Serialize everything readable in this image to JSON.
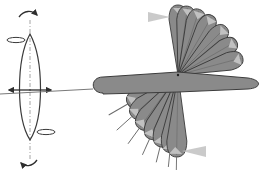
{
  "diagram": {
    "title": "",
    "colors": {
      "background": "#ffffff",
      "stroke": "#3a3a3a",
      "blade_fill": "#8a8a8a",
      "blade_stroke": "#3c3c3c",
      "marker_fill": "#c4c4c4",
      "axis_dash": "#9a9a9a",
      "tail_line": "#6a6a6a"
    },
    "left_figure": {
      "name": "spindle",
      "axis": "vertical-dashed",
      "arrows": [
        "rotation-top",
        "rotation-bottom",
        "double-headed-horizontal"
      ],
      "loops": [
        "upper-left-loop",
        "lower-right-loop"
      ]
    },
    "right_figure": {
      "name": "blade-fan",
      "pivot": [
        178,
        75
      ],
      "upper_blade_angles_deg": [
        0,
        -15,
        -30,
        -45,
        -60,
        -72,
        -82,
        -90
      ],
      "lower_blade_angles_deg": [
        150,
        138,
        126,
        114,
        104,
        96,
        91
      ],
      "labels": []
    }
  }
}
